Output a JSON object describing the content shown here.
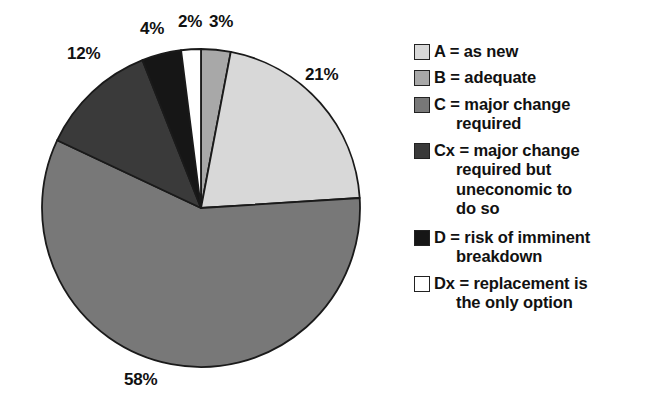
{
  "chart_data": {
    "type": "pie",
    "title": "",
    "subtitle": "",
    "xlabel": "",
    "ylabel": "",
    "legend_position": "right",
    "grid": false,
    "units": "percent",
    "categories": [
      "B",
      "A",
      "C",
      "Cx",
      "D",
      "Dx"
    ],
    "values": [
      3,
      21,
      58,
      12,
      4,
      2
    ],
    "slices": [
      {
        "code": "B",
        "label": "B = adequate",
        "value": 3,
        "value_label": "3%",
        "color": "#a8a8a8",
        "start_angle_deg": 0,
        "end_angle_deg": 10.8
      },
      {
        "code": "A",
        "label": "A = as new",
        "value": 21,
        "value_label": "21%",
        "color": "#d8d8d8",
        "start_angle_deg": 10.8,
        "end_angle_deg": 86.4
      },
      {
        "code": "C",
        "label": "C = major change required",
        "value": 58,
        "value_label": "58%",
        "color": "#787878",
        "start_angle_deg": 86.4,
        "end_angle_deg": 295.2
      },
      {
        "code": "Cx",
        "label": "Cx = major change required but uneconomic to do so",
        "value": 12,
        "value_label": "12%",
        "color": "#3a3a3a",
        "start_angle_deg": 295.2,
        "end_angle_deg": 338.4
      },
      {
        "code": "D",
        "label": "D = risk of imminent breakdown",
        "value": 4,
        "value_label": "4%",
        "color": "#161616",
        "start_angle_deg": 338.4,
        "end_angle_deg": 352.8
      },
      {
        "code": "Dx",
        "label": "Dx = replacement is the only option",
        "value": 2,
        "value_label": "2%",
        "color": "#ffffff",
        "start_angle_deg": 352.8,
        "end_angle_deg": 360
      }
    ],
    "data_labels": [
      {
        "text": "3%",
        "for": "B"
      },
      {
        "text": "21%",
        "for": "A"
      },
      {
        "text": "58%",
        "for": "C"
      },
      {
        "text": "12%",
        "for": "Cx"
      },
      {
        "text": "4%",
        "for": "D"
      },
      {
        "text": "2%",
        "for": "Dx"
      }
    ]
  },
  "pie": {
    "labels": {
      "a": "21%",
      "b": "3%",
      "c": "58%",
      "cx": "12%",
      "d": "4%",
      "dx": "2%"
    }
  },
  "legend": {
    "items": [
      {
        "code": "A",
        "swatch_color": "#d8d8d8",
        "line1": "A = as new",
        "line2": "",
        "line3": "",
        "line4": ""
      },
      {
        "code": "B",
        "swatch_color": "#a8a8a8",
        "line1": "B = adequate",
        "line2": "",
        "line3": "",
        "line4": ""
      },
      {
        "code": "C",
        "swatch_color": "#787878",
        "line1": "C = major change",
        "line2": "required",
        "line3": "",
        "line4": ""
      },
      {
        "code": "Cx",
        "swatch_color": "#3a3a3a",
        "line1": "Cx = major change",
        "line2": "required but",
        "line3": "uneconomic to",
        "line4": "do so"
      },
      {
        "code": "D",
        "swatch_color": "#161616",
        "line1": "D = risk of imminent",
        "line2": "breakdown",
        "line3": "",
        "line4": ""
      },
      {
        "code": "Dx",
        "swatch_color": "#ffffff",
        "line1": "Dx = replacement is",
        "line2": "the only option",
        "line3": "",
        "line4": ""
      }
    ]
  }
}
